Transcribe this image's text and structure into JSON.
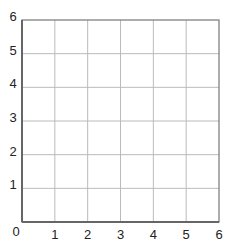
{
  "chart_data": {
    "type": "scatter",
    "title": "",
    "xlabel": "",
    "ylabel": "",
    "xlim": [
      0,
      6
    ],
    "ylim": [
      0,
      6
    ],
    "x_ticks": [
      0,
      1,
      2,
      3,
      4,
      5,
      6
    ],
    "y_ticks": [
      0,
      1,
      2,
      3,
      4,
      5,
      6
    ],
    "x_tick_labels": [
      "1",
      "2",
      "3",
      "4",
      "5",
      "6"
    ],
    "y_tick_labels": [
      "1",
      "2",
      "3",
      "4",
      "5",
      "6"
    ],
    "origin_label": "0",
    "grid": true,
    "series": [],
    "legend": null
  },
  "colors": {
    "axis": "#777777",
    "grid": "#bbbbbb",
    "text": "#222222",
    "background": "#ffffff"
  }
}
